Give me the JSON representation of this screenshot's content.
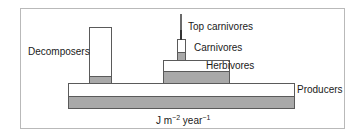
{
  "diagram": {
    "type": "pyramid-of-energy",
    "levels": [
      {
        "name": "Producers",
        "label": "Producers"
      },
      {
        "name": "Herbivores",
        "label": "Herbivores"
      },
      {
        "name": "Carnivores",
        "label": "Carnivores"
      },
      {
        "name": "Top carnivores",
        "label": "Top carnivores"
      },
      {
        "name": "Decomposers",
        "label": "Decomposers"
      }
    ],
    "unit": {
      "base": "J m",
      "exp1": "−2",
      "middle": " year",
      "exp2": "−1"
    },
    "colors": {
      "fill_upper": "#ffffff",
      "fill_lower": "#a9a9a9",
      "outline": "#5a5a5a",
      "frame": "#b9b9b9"
    }
  }
}
